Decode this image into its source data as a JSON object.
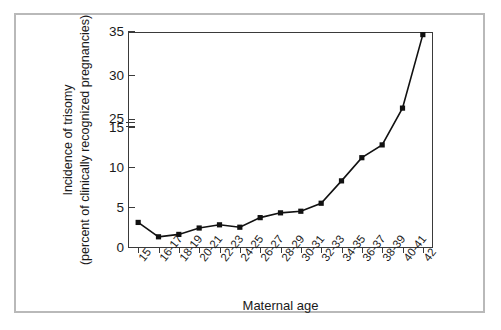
{
  "chart_data": {
    "type": "line",
    "title": "",
    "xlabel": "Maternal age",
    "ylabel_line1": "Incidence of trisomy",
    "ylabel_line2": "(percent of clinically recognized pregnancies)",
    "categories": [
      "15",
      "16-17",
      "18-19",
      "20-21",
      "22-23",
      "24-25",
      "26-27",
      "28-29",
      "30-31",
      "32-33",
      "34-35",
      "36-37",
      "38-39",
      "40-41",
      "42"
    ],
    "values": [
      3.2,
      1.4,
      1.7,
      2.5,
      2.9,
      2.6,
      3.8,
      4.4,
      4.6,
      5.6,
      8.4,
      11.3,
      12.9,
      26.3,
      34.7
    ],
    "yticks": [
      0,
      5,
      10,
      15,
      25,
      30,
      35
    ],
    "ylim": [
      0,
      35
    ],
    "y_axis_break": {
      "lower": 15,
      "upper": 25,
      "present": true
    },
    "grid": false,
    "legend": null,
    "marker_style": "filled-square",
    "line_color": "#111111",
    "frame_color": "#b9b9b9",
    "axis_color": "#3a3a3a",
    "background": "#ffffff"
  }
}
